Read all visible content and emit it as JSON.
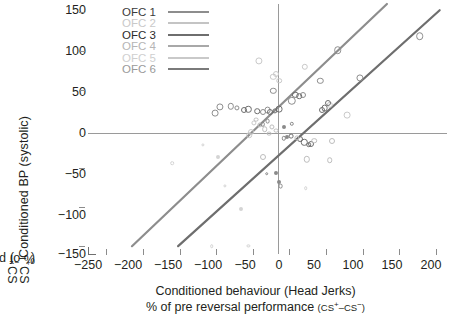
{
  "chart_data": {
    "type": "scatter",
    "title": "",
    "xlabel": "Conditioned behaviour (Head Jerks)",
    "xlabel_line2_prefix": "% of pre reversal performance ",
    "xlabel_line2_paren": "(CS+–CS−)",
    "ylabel_line1": "Conditioned BP (systolic)",
    "ylabel_line2_prefix": "% of pre reversal performance ",
    "ylabel_line2_paren": "(CS+–CS−)",
    "xlim": [
      -275,
      215
    ],
    "ylim": [
      -160,
      160
    ],
    "xticks": [
      -250,
      -200,
      -150,
      -100,
      -50,
      0,
      50,
      100,
      150,
      200
    ],
    "yticks": [
      150,
      100,
      50,
      0,
      -50,
      -100,
      -150
    ],
    "xtick_labels": [
      "−250",
      "−200",
      "−150",
      "−100",
      "−50",
      "0",
      "50",
      "100",
      "150",
      "200"
    ],
    "ytick_labels": [
      "150",
      "100",
      "50",
      "0",
      "−50",
      "−100",
      "−150"
    ],
    "grid": false,
    "zero_lines": true,
    "legend_position": "top-left",
    "series": [
      {
        "name": "OFC 1",
        "color": "#8d8d8d",
        "line": true,
        "regression": {
          "x1": -215,
          "y1": -150,
          "x2": 133,
          "y2": 160
        },
        "points": [
          {
            "x": -95,
            "y": 28,
            "r": 3.6
          },
          {
            "x": -102,
            "y": 20,
            "r": 3.4
          },
          {
            "x": -80,
            "y": 29,
            "r": 3.2
          },
          {
            "x": -72,
            "y": 27,
            "r": 2.6
          },
          {
            "x": -36,
            "y": 22,
            "r": 3.0
          },
          {
            "x": -30,
            "y": 24,
            "r": 3.4
          },
          {
            "x": -22,
            "y": 49,
            "r": 3.2
          },
          {
            "x": 3,
            "y": 36,
            "r": 4.2
          },
          {
            "x": 18,
            "y": 44,
            "r": 3.0
          },
          {
            "x": 42,
            "y": 62,
            "r": 3.2
          },
          {
            "x": 66,
            "y": 101,
            "r": 3.8
          },
          {
            "x": 96,
            "y": 65,
            "r": 3.6
          },
          {
            "x": 178,
            "y": 119,
            "r": 3.8
          }
        ]
      },
      {
        "name": "OFC 2",
        "color": "#c9c9c9",
        "line": true,
        "points": [
          {
            "x": -42,
            "y": 87,
            "r": 3.6
          },
          {
            "x": -22,
            "y": 67,
            "r": 3.2
          },
          {
            "x": -18,
            "y": 70,
            "r": 3.0
          },
          {
            "x": -14,
            "y": 62,
            "r": 2.8
          },
          {
            "x": -48,
            "y": 8,
            "r": 2.6
          },
          {
            "x": -52,
            "y": -4,
            "r": 3.0
          },
          {
            "x": -55,
            "y": -8,
            "r": 2.8
          },
          {
            "x": 55,
            "y": 31,
            "r": 3.2
          },
          {
            "x": 79,
            "y": 18,
            "r": 3.4
          },
          {
            "x": 21,
            "y": 80,
            "r": 3.2
          }
        ]
      },
      {
        "name": "OFC 3",
        "color": "#6e6e6e",
        "line": true,
        "regression": {
          "x1": -152,
          "y1": -150,
          "x2": 205,
          "y2": 152
        },
        "points": [
          {
            "x": -62,
            "y": 24,
            "r": 3.0
          },
          {
            "x": -56,
            "y": 25,
            "r": 3.2
          },
          {
            "x": -44,
            "y": 23,
            "r": 2.8
          },
          {
            "x": -26,
            "y": 22,
            "r": 3.0
          },
          {
            "x": -20,
            "y": 23,
            "r": 2.6
          },
          {
            "x": -14,
            "y": 25,
            "r": 3.4
          },
          {
            "x": 8,
            "y": 44,
            "r": 3.2
          },
          {
            "x": 13,
            "y": 42,
            "r": 2.8
          },
          {
            "x": 44,
            "y": 24,
            "r": 3.0
          },
          {
            "x": 48,
            "y": 27,
            "r": 3.4
          },
          {
            "x": 52,
            "y": 33,
            "r": 3.0
          },
          {
            "x": 2,
            "y": -9,
            "r": 2.4
          },
          {
            "x": 14,
            "y": -13,
            "r": 3.0
          },
          {
            "x": 20,
            "y": -17,
            "r": 3.2
          },
          {
            "x": 26,
            "y": -20,
            "r": 2.8
          },
          {
            "x": 30,
            "y": -19,
            "r": 3.0
          }
        ]
      },
      {
        "name": "OFC 4",
        "color": "#bdbdbd",
        "line": true,
        "points": [
          {
            "x": -46,
            "y": 12,
            "r": 2.4
          },
          {
            "x": -40,
            "y": 5,
            "r": 2.6
          },
          {
            "x": -34,
            "y": 0,
            "r": 2.8
          },
          {
            "x": -28,
            "y": -6,
            "r": 2.4
          },
          {
            "x": -24,
            "y": 3,
            "r": 2.6
          },
          {
            "x": -18,
            "y": -2,
            "r": 2.4
          },
          {
            "x": 10,
            "y": -11,
            "r": 2.6
          },
          {
            "x": 34,
            "y": -15,
            "r": 2.8
          },
          {
            "x": 58,
            "y": -15,
            "r": 3.0
          },
          {
            "x": -36,
            "y": -36,
            "r": 3.0
          },
          {
            "x": 24,
            "y": -39,
            "r": 3.2
          },
          {
            "x": 55,
            "y": -40,
            "r": 2.8
          }
        ]
      },
      {
        "name": "OFC 5",
        "color": "#d4d4d4",
        "line": true,
        "points": [
          {
            "x": -160,
            "y": -44,
            "r": 1.8
          },
          {
            "x": -118,
            "y": -20,
            "r": 1.6
          },
          {
            "x": -98,
            "y": -36,
            "r": 2.0
          },
          {
            "x": -88,
            "y": -73,
            "r": 1.6
          },
          {
            "x": -66,
            "y": -102,
            "r": 2.0
          },
          {
            "x": -106,
            "y": -150,
            "r": 1.8
          },
          {
            "x": -56,
            "y": -150,
            "r": 1.6
          },
          {
            "x": 22,
            "y": -76,
            "r": 1.8
          }
        ]
      },
      {
        "name": "OFC 6",
        "color": "#8a8a8a",
        "line": true,
        "points": [
          {
            "x": -31,
            "y": -57,
            "r": 1.8
          },
          {
            "x": -18,
            "y": -56,
            "r": 2.0
          },
          {
            "x": -14,
            "y": -68,
            "r": 2.0
          },
          {
            "x": -12,
            "y": -73,
            "r": 2.4
          },
          {
            "x": -8,
            "y": -12,
            "r": 2.2
          },
          {
            "x": -4,
            "y": -10,
            "r": 2.0
          },
          {
            "x": -30,
            "y": 10,
            "r": 2.4
          },
          {
            "x": -36,
            "y": 6,
            "r": 2.2
          },
          {
            "x": 3,
            "y": 7,
            "r": 2.2
          },
          {
            "x": -8,
            "y": 2,
            "r": 2.0
          }
        ]
      }
    ]
  },
  "legend": {
    "items": [
      {
        "label": "OFC 1",
        "color": "#8d8d8d",
        "text_color": "#3a3a3a"
      },
      {
        "label": "OFC 2",
        "color": "#c4c4c4",
        "text_color": "#c9c9c9"
      },
      {
        "label": "OFC 3",
        "color": "#6e6e6e",
        "text_color": "#2b2b2b"
      },
      {
        "label": "OFC 4",
        "color": "#a8a8a8",
        "text_color": "#b5b5b5"
      },
      {
        "label": "OFC 5",
        "color": "#c9c9c9",
        "text_color": "#cfcfcf"
      },
      {
        "label": "OFC 6",
        "color": "#7a7a7a",
        "text_color": "#9a9a9a"
      }
    ]
  }
}
